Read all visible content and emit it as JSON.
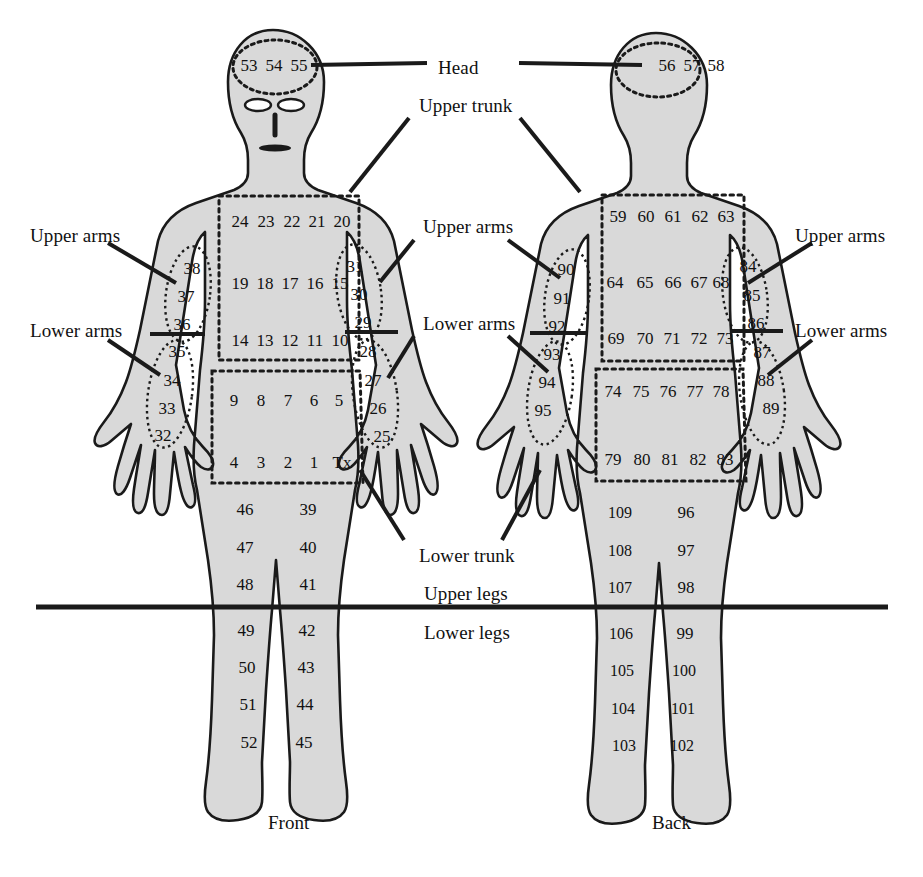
{
  "diagram": {
    "colors": {
      "body_fill": "#d9d9d9",
      "outline": "#1a1a1a",
      "text": "#111111",
      "background": "#ffffff"
    },
    "captions": [
      {
        "text": "Front",
        "x": 268,
        "y": 812
      },
      {
        "text": "Back",
        "x": 652,
        "y": 812
      }
    ],
    "labels": [
      {
        "name": "head",
        "text": "Head",
        "x": 438,
        "y": 57
      },
      {
        "name": "upper-trunk",
        "text": "Upper trunk",
        "x": 419,
        "y": 95
      },
      {
        "name": "upper-arms-left",
        "text": "Upper arms",
        "x": 30,
        "y": 225
      },
      {
        "name": "lower-arms-left",
        "text": "Lower arms",
        "x": 30,
        "y": 320
      },
      {
        "name": "upper-arms-center",
        "text": "Upper arms",
        "x": 423,
        "y": 216
      },
      {
        "name": "lower-arms-center",
        "text": "Lower arms",
        "x": 423,
        "y": 313
      },
      {
        "name": "upper-arms-right",
        "text": "Upper arms",
        "x": 795,
        "y": 225
      },
      {
        "name": "lower-arms-right",
        "text": "Lower arms",
        "x": 795,
        "y": 320
      },
      {
        "name": "lower-trunk",
        "text": "Lower trunk",
        "x": 419,
        "y": 545
      },
      {
        "name": "upper-legs",
        "text": "Upper legs",
        "x": 424,
        "y": 583
      },
      {
        "name": "lower-legs",
        "text": "Lower legs",
        "x": 424,
        "y": 622
      }
    ],
    "regions": {
      "front_head": [
        "53",
        "54",
        "55"
      ],
      "back_head": [
        "56",
        "57",
        "58"
      ],
      "front_upper_trunk": [
        [
          "24",
          "23",
          "22",
          "21",
          "20"
        ],
        [
          "19",
          "18",
          "17",
          "16",
          "15"
        ],
        [
          "14",
          "13",
          "12",
          "11",
          "10"
        ]
      ],
      "front_lower_trunk": [
        [
          "9",
          "8",
          "7",
          "6",
          "5"
        ],
        [
          "4",
          "3",
          "2",
          "1",
          "Tx"
        ]
      ],
      "back_upper_trunk": [
        [
          "59",
          "60",
          "61",
          "62",
          "63"
        ],
        [
          "64",
          "65",
          "66",
          "67",
          "68"
        ],
        [
          "69",
          "70",
          "71",
          "72",
          "73"
        ]
      ],
      "back_lower_trunk": [
        [
          "74",
          "75",
          "76",
          "77",
          "78"
        ],
        [
          "79",
          "80",
          "81",
          "82",
          "83"
        ]
      ],
      "front_left_upper_arm": [
        "38",
        "37",
        "36"
      ],
      "front_left_lower_arm": [
        "35",
        "34",
        "33",
        "32"
      ],
      "front_right_upper_arm": [
        "31",
        "30",
        "29"
      ],
      "front_right_lower_arm": [
        "28",
        "27",
        "26",
        "25"
      ],
      "back_left_upper_arm": [
        "90",
        "91",
        "92"
      ],
      "back_left_lower_arm": [
        "93",
        "94",
        "95"
      ],
      "back_right_upper_arm": [
        "84",
        "85",
        "86"
      ],
      "back_right_lower_arm": [
        "87",
        "88",
        "89"
      ],
      "front_left_upper_leg": [
        "46",
        "47",
        "48"
      ],
      "front_left_lower_leg": [
        "49",
        "50",
        "51",
        "52"
      ],
      "front_right_upper_leg": [
        "39",
        "40",
        "41"
      ],
      "front_right_lower_leg": [
        "42",
        "43",
        "44",
        "45"
      ],
      "back_left_upper_leg": [
        "109",
        "108",
        "107"
      ],
      "back_left_lower_leg": [
        "106",
        "105",
        "104",
        "103"
      ],
      "back_right_upper_leg": [
        "96",
        "97",
        "98"
      ],
      "back_right_lower_leg": [
        "99",
        "100",
        "101",
        "102"
      ]
    },
    "numbers": [
      {
        "t": "53",
        "x": 249,
        "y": 66
      },
      {
        "t": "54",
        "x": 274,
        "y": 66
      },
      {
        "t": "55",
        "x": 299,
        "y": 66
      },
      {
        "t": "56",
        "x": 667,
        "y": 66
      },
      {
        "t": "57",
        "x": 692,
        "y": 66
      },
      {
        "t": "58",
        "x": 716,
        "y": 66
      },
      {
        "t": "24",
        "x": 240,
        "y": 222
      },
      {
        "t": "23",
        "x": 266,
        "y": 222
      },
      {
        "t": "22",
        "x": 292,
        "y": 222
      },
      {
        "t": "21",
        "x": 317,
        "y": 222
      },
      {
        "t": "20",
        "x": 342,
        "y": 222
      },
      {
        "t": "19",
        "x": 240,
        "y": 284
      },
      {
        "t": "18",
        "x": 265,
        "y": 284
      },
      {
        "t": "17",
        "x": 290,
        "y": 284
      },
      {
        "t": "16",
        "x": 315,
        "y": 284
      },
      {
        "t": "15",
        "x": 340,
        "y": 284
      },
      {
        "t": "14",
        "x": 240,
        "y": 341
      },
      {
        "t": "13",
        "x": 265,
        "y": 341
      },
      {
        "t": "12",
        "x": 290,
        "y": 341
      },
      {
        "t": "11",
        "x": 315,
        "y": 341
      },
      {
        "t": "10",
        "x": 340,
        "y": 341
      },
      {
        "t": "9",
        "x": 234,
        "y": 401
      },
      {
        "t": "8",
        "x": 261,
        "y": 401
      },
      {
        "t": "7",
        "x": 288,
        "y": 401
      },
      {
        "t": "6",
        "x": 314,
        "y": 401
      },
      {
        "t": "5",
        "x": 339,
        "y": 401
      },
      {
        "t": "4",
        "x": 234,
        "y": 463
      },
      {
        "t": "3",
        "x": 261,
        "y": 463
      },
      {
        "t": "2",
        "x": 288,
        "y": 463
      },
      {
        "t": "1",
        "x": 314,
        "y": 463
      },
      {
        "t": "Tx",
        "x": 342,
        "y": 463
      },
      {
        "t": "59",
        "x": 618,
        "y": 217
      },
      {
        "t": "60",
        "x": 646,
        "y": 217
      },
      {
        "t": "61",
        "x": 673,
        "y": 217
      },
      {
        "t": "62",
        "x": 700,
        "y": 217
      },
      {
        "t": "63",
        "x": 726,
        "y": 217
      },
      {
        "t": "64",
        "x": 615,
        "y": 283
      },
      {
        "t": "65",
        "x": 645,
        "y": 283
      },
      {
        "t": "66",
        "x": 673,
        "y": 283
      },
      {
        "t": "67",
        "x": 699,
        "y": 283
      },
      {
        "t": "68",
        "x": 721,
        "y": 283
      },
      {
        "t": "69",
        "x": 616,
        "y": 339
      },
      {
        "t": "70",
        "x": 645,
        "y": 339
      },
      {
        "t": "71",
        "x": 672,
        "y": 339
      },
      {
        "t": "72",
        "x": 699,
        "y": 339
      },
      {
        "t": "73",
        "x": 725,
        "y": 339
      },
      {
        "t": "74",
        "x": 613,
        "y": 392
      },
      {
        "t": "75",
        "x": 641,
        "y": 392
      },
      {
        "t": "76",
        "x": 668,
        "y": 392
      },
      {
        "t": "77",
        "x": 695,
        "y": 392
      },
      {
        "t": "78",
        "x": 721,
        "y": 392
      },
      {
        "t": "79",
        "x": 613,
        "y": 460
      },
      {
        "t": "80",
        "x": 642,
        "y": 460
      },
      {
        "t": "81",
        "x": 670,
        "y": 460
      },
      {
        "t": "82",
        "x": 698,
        "y": 460
      },
      {
        "t": "83",
        "x": 725,
        "y": 460
      },
      {
        "t": "38",
        "x": 192,
        "y": 269
      },
      {
        "t": "37",
        "x": 186,
        "y": 297
      },
      {
        "t": "36",
        "x": 182,
        "y": 325
      },
      {
        "t": "35",
        "x": 177,
        "y": 352
      },
      {
        "t": "34",
        "x": 172,
        "y": 381
      },
      {
        "t": "33",
        "x": 167,
        "y": 409
      },
      {
        "t": "32",
        "x": 163,
        "y": 436
      },
      {
        "t": "31",
        "x": 355,
        "y": 267
      },
      {
        "t": "30",
        "x": 359,
        "y": 295
      },
      {
        "t": "29",
        "x": 363,
        "y": 323
      },
      {
        "t": "28",
        "x": 368,
        "y": 352
      },
      {
        "t": "27",
        "x": 373,
        "y": 381
      },
      {
        "t": "26",
        "x": 378,
        "y": 409
      },
      {
        "t": "25",
        "x": 382,
        "y": 437
      },
      {
        "t": "90",
        "x": 566,
        "y": 270
      },
      {
        "t": "91",
        "x": 562,
        "y": 299
      },
      {
        "t": "92",
        "x": 557,
        "y": 327
      },
      {
        "t": "93",
        "x": 552,
        "y": 355
      },
      {
        "t": "94",
        "x": 547,
        "y": 383
      },
      {
        "t": "95",
        "x": 543,
        "y": 411
      },
      {
        "t": "84",
        "x": 748,
        "y": 267
      },
      {
        "t": "85",
        "x": 752,
        "y": 296
      },
      {
        "t": "86",
        "x": 756,
        "y": 324
      },
      {
        "t": "87",
        "x": 762,
        "y": 353
      },
      {
        "t": "88",
        "x": 766,
        "y": 381
      },
      {
        "t": "89",
        "x": 771,
        "y": 409
      },
      {
        "t": "46",
        "x": 245,
        "y": 510
      },
      {
        "t": "47",
        "x": 245,
        "y": 548
      },
      {
        "t": "48",
        "x": 245,
        "y": 585
      },
      {
        "t": "49",
        "x": 246,
        "y": 631
      },
      {
        "t": "50",
        "x": 247,
        "y": 668
      },
      {
        "t": "51",
        "x": 248,
        "y": 705
      },
      {
        "t": "52",
        "x": 249,
        "y": 743
      },
      {
        "t": "39",
        "x": 308,
        "y": 510
      },
      {
        "t": "40",
        "x": 308,
        "y": 548
      },
      {
        "t": "41",
        "x": 308,
        "y": 585
      },
      {
        "t": "42",
        "x": 307,
        "y": 631
      },
      {
        "t": "43",
        "x": 306,
        "y": 668
      },
      {
        "t": "44",
        "x": 305,
        "y": 705
      },
      {
        "t": "45",
        "x": 304,
        "y": 743
      },
      {
        "t": "109",
        "x": 620,
        "y": 513
      },
      {
        "t": "108",
        "x": 620,
        "y": 551
      },
      {
        "t": "107",
        "x": 620,
        "y": 588
      },
      {
        "t": "106",
        "x": 621,
        "y": 634
      },
      {
        "t": "105",
        "x": 622,
        "y": 671
      },
      {
        "t": "104",
        "x": 623,
        "y": 709
      },
      {
        "t": "103",
        "x": 624,
        "y": 746
      },
      {
        "t": "96",
        "x": 686,
        "y": 513
      },
      {
        "t": "97",
        "x": 686,
        "y": 551
      },
      {
        "t": "98",
        "x": 686,
        "y": 588
      },
      {
        "t": "99",
        "x": 685,
        "y": 634
      },
      {
        "t": "100",
        "x": 684,
        "y": 671
      },
      {
        "t": "101",
        "x": 683,
        "y": 709
      },
      {
        "t": "102",
        "x": 682,
        "y": 746
      }
    ]
  }
}
